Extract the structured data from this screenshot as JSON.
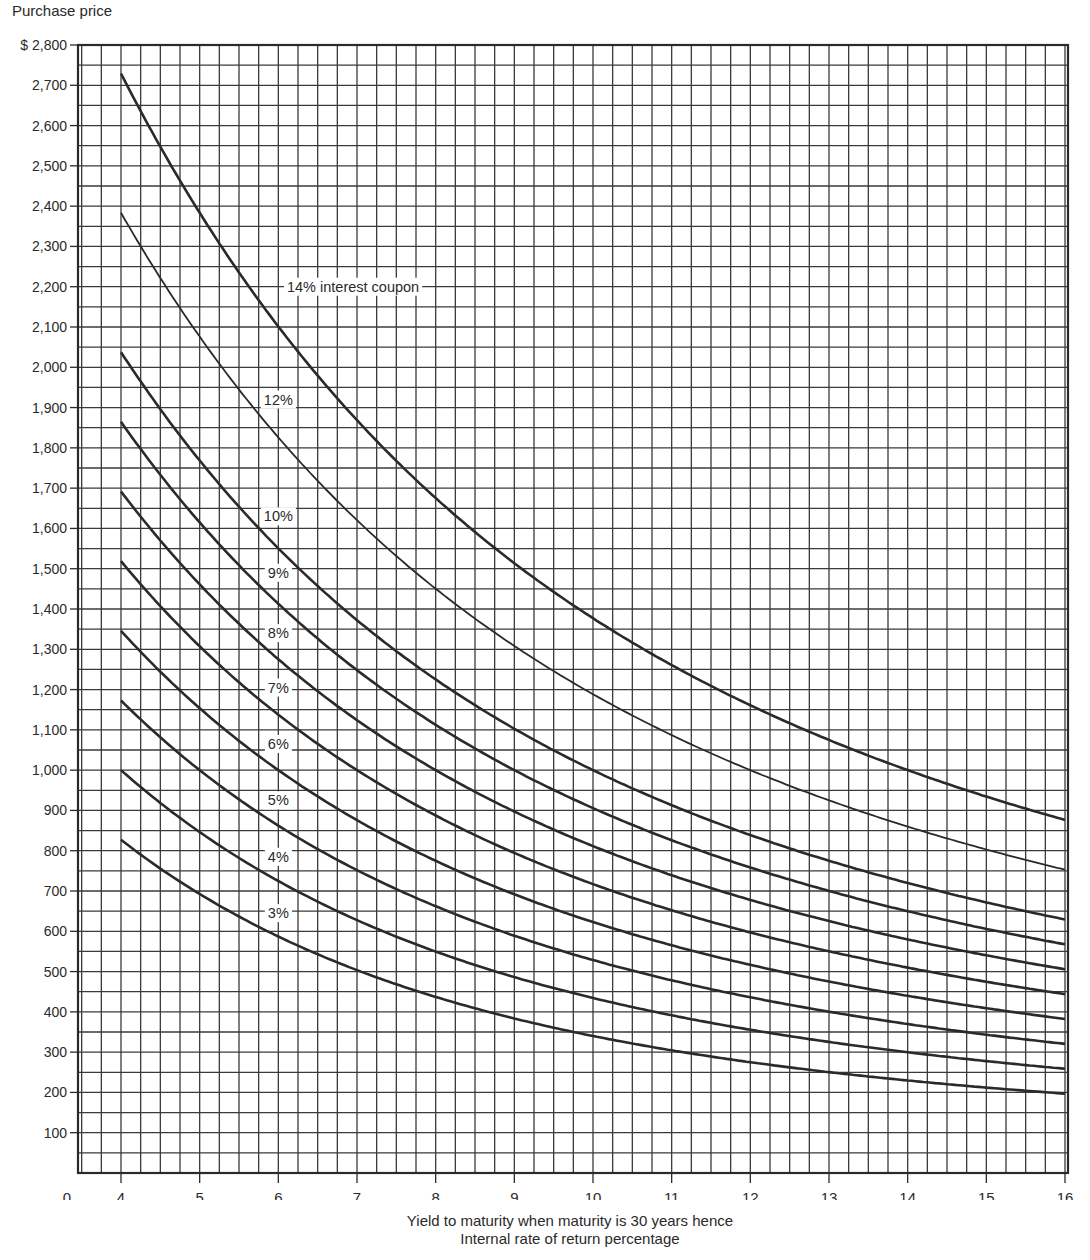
{
  "chart_data": {
    "type": "line",
    "title": "",
    "ylabel": "Purchase price",
    "xlabel": "Yield to maturity when maturity is 30 years hence",
    "xlabel_secondary": "Internal rate of return percentage",
    "xlim": [
      3.45,
      16
    ],
    "ylim": [
      0,
      2800
    ],
    "x_ticks": [
      4,
      5,
      6,
      7,
      8,
      9,
      10,
      11,
      12,
      13,
      14,
      15,
      16
    ],
    "x_tick_labels": [
      "0",
      "4",
      "5",
      "6",
      "7",
      "8",
      "9",
      "10",
      "11",
      "12",
      "13",
      "14",
      "15",
      "16"
    ],
    "y_ticks": [
      100,
      200,
      300,
      400,
      500,
      600,
      700,
      800,
      900,
      1000,
      1100,
      1200,
      1300,
      1400,
      1500,
      1600,
      1700,
      1800,
      1900,
      2000,
      2100,
      2200,
      2300,
      2400,
      2500,
      2600,
      2700,
      2800
    ],
    "y_tick_labels": [
      "100",
      "200",
      "300",
      "400",
      "500",
      "600",
      "700",
      "800",
      "900",
      "1,000",
      "1,100",
      "1,200",
      "1,300",
      "1,400",
      "1,500",
      "1,600",
      "1,700",
      "1,800",
      "1,900",
      "2,000",
      "2,100",
      "2,200",
      "2,300",
      "2,400",
      "2,500",
      "2,600",
      "2,700",
      "$ 2,800"
    ],
    "grid": true,
    "grid_minor_x_step": 0.25,
    "grid_minor_y_step": 50,
    "legend": "inline labels",
    "maturity_years": 30,
    "face_value": 1000,
    "x": [
      4,
      5,
      6,
      7,
      8,
      9,
      10,
      11,
      12,
      13,
      14,
      15,
      16
    ],
    "series": [
      {
        "name": "14% interest coupon",
        "coupon": 14,
        "label": "14% interest coupon",
        "label_x": 6.95,
        "values": [
          2729,
          2383,
          2101,
          1869,
          1675,
          1513,
          1377,
          1261,
          1161,
          1075,
          1000,
          934,
          876
        ]
      },
      {
        "name": "12%",
        "coupon": 12,
        "label": "12%",
        "label_x": 6.0,
        "values": [
          2383,
          2076,
          1826,
          1620,
          1450,
          1307,
          1189,
          1087,
          1000,
          925,
          860,
          803,
          752
        ]
      },
      {
        "name": "10%",
        "coupon": 10,
        "label": "10%",
        "label_x": 6.0,
        "values": [
          2037,
          1769,
          1551,
          1372,
          1225,
          1102,
          1000,
          914,
          839,
          775,
          720,
          672,
          630
        ]
      },
      {
        "name": "9%",
        "coupon": 9,
        "label": "9%",
        "label_x": 6.0,
        "values": [
          1865,
          1615,
          1413,
          1248,
          1113,
          1000,
          906,
          827,
          758,
          700,
          650,
          606,
          568
        ]
      },
      {
        "name": "8%",
        "coupon": 8,
        "label": "8%",
        "label_x": 6.0,
        "values": [
          1692,
          1461,
          1275,
          1124,
          1000,
          897,
          811,
          740,
          677,
          625,
          580,
          541,
          507
        ]
      },
      {
        "name": "7%",
        "coupon": 7,
        "label": "7%",
        "label_x": 6.0,
        "values": [
          1519,
          1307,
          1138,
          1000,
          887,
          795,
          717,
          653,
          597,
          550,
          510,
          475,
          445
        ]
      },
      {
        "name": "6%",
        "coupon": 6,
        "label": "6%",
        "label_x": 6.0,
        "values": [
          1346,
          1154,
          1000,
          876,
          775,
          692,
          623,
          566,
          516,
          475,
          440,
          409,
          383
        ]
      },
      {
        "name": "5%",
        "coupon": 5,
        "label": "5%",
        "label_x": 6.0,
        "values": [
          1173,
          1000,
          862,
          752,
          662,
          589,
          529,
          479,
          436,
          400,
          370,
          344,
          321
        ]
      },
      {
        "name": "4%",
        "coupon": 4,
        "label": "4%",
        "label_x": 6.0,
        "values": [
          1000,
          846,
          725,
          628,
          550,
          487,
          434,
          392,
          355,
          325,
          300,
          278,
          259
        ]
      },
      {
        "name": "3%",
        "coupon": 3,
        "label": "3%",
        "label_x": 6.0,
        "values": [
          827,
          693,
          587,
          504,
          437,
          384,
          340,
          305,
          275,
          250,
          230,
          213,
          197
        ]
      }
    ]
  },
  "labels": {
    "y_axis_title": "Purchase price",
    "x_axis_title_line1": "Yield to maturity when maturity is 30 years hence",
    "x_axis_title_line2": "Internal rate of return percentage"
  },
  "colors": {
    "ink": "#2a2a2a",
    "grid": "#3a3a3a",
    "background": "#ffffff"
  }
}
